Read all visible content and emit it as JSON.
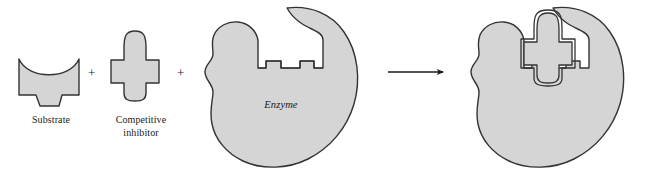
{
  "figure": {
    "background_color": "#ffffff",
    "shape_fill_color": "#d5d5d5",
    "shape_stroke_color": "#333333",
    "text_color": "#1a1a1a"
  },
  "labels": {
    "substrate": "Substrate",
    "inhibitor_line1": "Competitive",
    "inhibitor_line2": "inhibitor",
    "enzyme": "Enzyme",
    "plus_1": "+",
    "plus_2": "+"
  },
  "icons": {
    "substrate": "substrate-shape-icon",
    "inhibitor": "competitive-inhibitor-shape-icon",
    "enzyme": "enzyme-blob-icon",
    "arrow": "right-arrow-icon",
    "complex": "enzyme-inhibitor-complex-icon"
  },
  "diagram_elements": [
    {
      "name": "substrate",
      "label": "Substrate",
      "role": "reactant"
    },
    {
      "name": "competitive-inhibitor",
      "label": "Competitive inhibitor",
      "role": "reactant"
    },
    {
      "name": "enzyme",
      "label": "Enzyme",
      "role": "reactant"
    },
    {
      "name": "reaction-arrow",
      "label": "",
      "role": "operator"
    },
    {
      "name": "enzyme-inhibitor-complex",
      "label": "",
      "role": "product"
    }
  ]
}
